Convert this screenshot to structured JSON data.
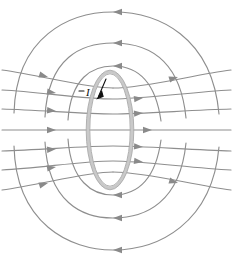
{
  "figure": {
    "background_color": "#ffffff",
    "width_px": 234,
    "height_px": 267
  },
  "labels": {
    "current_label": "I",
    "current_label_x": 86,
    "current_label_y": 93
  },
  "colors": {
    "field_line": "#8e8e8e",
    "arrowhead": "#8a8a8a",
    "loop_tube_outer": "#c9c9c9",
    "loop_tube_inner": "#a9a9a9",
    "current_arrow": "#101010",
    "background": "#ffffff"
  },
  "loop": {
    "semantic_name": "current-carrying-loop",
    "shape": "ellipse",
    "center_x": 110,
    "center_y": 130,
    "radius_x": 22,
    "radius_y": 58,
    "tube_thickness_px": 3.2
  },
  "current_arrow": {
    "semantic_name": "current-direction-arrow",
    "from_x": 106,
    "from_y": 79,
    "to_x": 98,
    "to_y": 97,
    "direction": "down-left"
  },
  "chart_data": {
    "type": "line",
    "xlabel": "",
    "ylabel": "",
    "legend": [],
    "annotations": [
      {
        "text": "I",
        "x": 86,
        "y": 93,
        "meaning": "current direction in loop"
      }
    ],
    "series": [
      {
        "name": "top-closed-loop-outer",
        "group": "top",
        "path": "M 14 113 C 16 36 70 12 113 12 C 158 12 212 36 219 114",
        "arrow": {
          "x": 113,
          "y": 12,
          "angle": 180
        }
      },
      {
        "name": "top-closed-loop-middle",
        "group": "top",
        "path": "M 45 117 C 48 57 82 43 113 43 C 146 43 180 57 186 118",
        "arrow": {
          "x": 113,
          "y": 43,
          "angle": 180
        }
      },
      {
        "name": "top-closed-loop-inner",
        "group": "top",
        "path": "M 68 120 C 71 78 92 66 113 66 C 135 66 155 78 161 121",
        "arrow": {
          "x": 113,
          "y": 66,
          "angle": 180
        }
      },
      {
        "name": "bottom-closed-loop-inner",
        "group": "bottom",
        "path": "M 68 139 C 71 181 92 195 113 195 C 135 195 155 183 161 140",
        "arrow": {
          "x": 113,
          "y": 195,
          "angle": 180
        }
      },
      {
        "name": "bottom-closed-loop-middle",
        "group": "bottom",
        "path": "M 45 142 C 48 202 82 218 113 218 C 146 218 180 202 186 143",
        "arrow": {
          "x": 113,
          "y": 218,
          "angle": 180
        }
      },
      {
        "name": "bottom-closed-loop-outer",
        "group": "bottom",
        "path": "M 14 146 C 16 224 70 250 113 250 C 158 250 212 224 219 147",
        "arrow": {
          "x": 113,
          "y": 250,
          "angle": 180
        }
      },
      {
        "name": "through-line-upper-outer",
        "group": "through",
        "path": "M 2 90 C 40 92 84 99 113 99 C 142 99 192 92 231 90",
        "arrow": {
          "x": 140,
          "y": 98,
          "angle": 355
        }
      },
      {
        "name": "through-line-upper-inner",
        "group": "through",
        "path": "M 2 109 C 40 110 84 114 113 114 C 142 114 192 110 231 109",
        "arrow": {
          "x": 140,
          "y": 113,
          "angle": 357
        }
      },
      {
        "name": "through-line-center",
        "group": "through",
        "path": "M 2 130 L 231 130",
        "arrow": {
          "x": 140,
          "y": 130,
          "angle": 0
        }
      },
      {
        "name": "through-line-lower-inner",
        "group": "through",
        "path": "M 2 151 C 40 150 84 146 113 146 C 142 146 192 150 231 151",
        "arrow": {
          "x": 140,
          "y": 147,
          "angle": 3
        }
      },
      {
        "name": "through-line-lower-outer",
        "group": "through",
        "path": "M 2 170 C 40 168 84 161 113 161 C 142 161 192 168 231 170",
        "arrow": {
          "x": 140,
          "y": 162,
          "angle": 5
        }
      },
      {
        "name": "outer-sweep-left-upper",
        "group": "outer",
        "path": "M 2 70 C 40 75 86 88 113 88",
        "arrow": {
          "x": 48,
          "y": 77,
          "angle": 16
        }
      },
      {
        "name": "outer-sweep-right-upper",
        "group": "outer",
        "path": "M 113 88 C 146 88 192 75 231 70",
        "arrow": {
          "x": 178,
          "y": 77,
          "angle": 344
        }
      },
      {
        "name": "outer-sweep-left-lower",
        "group": "outer",
        "path": "M 2 190 C 40 185 86 172 113 172",
        "arrow": {
          "x": 48,
          "y": 183,
          "angle": 344
        }
      },
      {
        "name": "outer-sweep-right-lower",
        "group": "outer",
        "path": "M 113 172 C 146 172 192 185 231 190",
        "arrow": {
          "x": 178,
          "y": 183,
          "angle": 16
        }
      }
    ],
    "grid": false,
    "axis_visible": false
  }
}
